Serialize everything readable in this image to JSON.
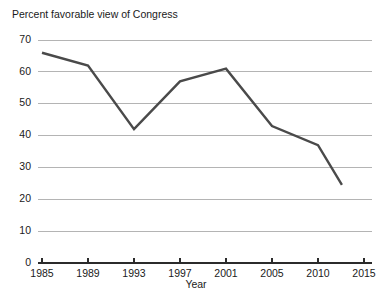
{
  "chart_data": {
    "type": "line",
    "title": "Percent favorable view of Congress",
    "xlabel": "Year",
    "ylabel": "",
    "categories": [
      "1985",
      "1989",
      "1993",
      "1997",
      "2001",
      "2005",
      "2010",
      "2015"
    ],
    "values": [
      66,
      62,
      42,
      57,
      61,
      43,
      37,
      null
    ],
    "series": [
      {
        "name": "Percent favorable view of Congress",
        "values": [
          66,
          62,
          42,
          57,
          61,
          43,
          37,
          null
        ]
      }
    ],
    "partial_final_segment": {
      "from_category": "2010",
      "from_value": 37,
      "end_value": 24.5,
      "end_fraction_to_next_category": 0.52,
      "note": "line stops before reaching 2015"
    },
    "ylim": [
      0,
      70
    ],
    "yticks": [
      0,
      10,
      20,
      30,
      40,
      50,
      60,
      70
    ],
    "ytick_labels": [
      "0",
      "10",
      "20",
      "30",
      "40",
      "50",
      "60",
      "70"
    ],
    "xtick_labels": [
      "1985",
      "1989",
      "1993",
      "1997",
      "2001",
      "2005",
      "2010",
      "2015"
    ],
    "grid": "horizontal",
    "legend": "none",
    "line_color": "#4a4a4a",
    "grid_color": "#b4b4b4",
    "axis_color": "#2b2b2b",
    "background_color": "#ffffff"
  }
}
